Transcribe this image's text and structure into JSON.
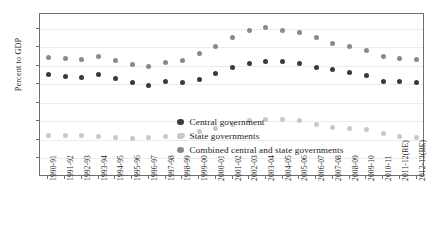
{
  "chart_data": {
    "type": "scatter",
    "title": "",
    "xlabel": "",
    "ylabel": "Percent to GDP",
    "ylim": [
      0,
      88
    ],
    "yticks": [
      10,
      20,
      30,
      40,
      50,
      60,
      70,
      80
    ],
    "grid": true,
    "legend_position": "inside-lower-right",
    "categories": [
      "1990-91",
      "1991-92",
      "1992-93",
      "1993-94",
      "1994-95",
      "1995-96",
      "1996-97",
      "1997-98",
      "1998-99",
      "1999-00",
      "2000-01",
      "2001-02",
      "2002-03",
      "2003-04",
      "2004-05",
      "2005-06",
      "2006-07",
      "2007-08",
      "2008-09",
      "2009-10",
      "2010-11",
      "2011-12(RE)",
      "2012-13(BE)"
    ],
    "series": [
      {
        "name": "Central government",
        "color": "#3a3a3a",
        "values": [
          55.3,
          54.2,
          53.7,
          55.3,
          53.2,
          50.9,
          49.6,
          51.3,
          51.2,
          52.6,
          55.8,
          58.9,
          61.4,
          62.5,
          62.1,
          61.4,
          59.3,
          58.0,
          56.5,
          54.6,
          51.7,
          51.6,
          50.9
        ]
      },
      {
        "name": "State governments",
        "color": "#c8c8c8",
        "values": [
          22.4,
          22.6,
          22.5,
          21.8,
          21.5,
          20.9,
          21.1,
          21.7,
          22.6,
          24.4,
          26.4,
          28.3,
          30.7,
          31.1,
          30.9,
          30.4,
          28.4,
          26.6,
          26.1,
          25.5,
          23.5,
          22.1,
          21.5
        ]
      },
      {
        "name": "Combined central and state governments",
        "color": "#8a8a8a",
        "values": [
          64.6,
          63.9,
          63.5,
          65.1,
          63.0,
          61.0,
          59.4,
          61.9,
          62.7,
          66.7,
          70.6,
          75.4,
          79.0,
          80.5,
          79.0,
          77.9,
          75.2,
          72.1,
          70.2,
          68.4,
          64.9,
          63.8,
          63.6
        ]
      }
    ]
  },
  "legend": {
    "items": [
      {
        "label": "Central government",
        "color": "#3a3a3a"
      },
      {
        "label": "State governments",
        "color": "#c8c8c8"
      },
      {
        "label": "Combined central and state governments",
        "color": "#8a8a8a"
      }
    ]
  }
}
